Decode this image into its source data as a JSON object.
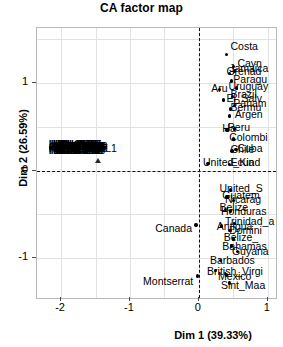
{
  "chart_data": {
    "type": "scatter",
    "title": "CA factor map",
    "xlabel": "Dim 1 (39.33%)",
    "ylabel": "Dim 2 (26.59%)",
    "xlim": [
      -2.35,
      1.12
    ],
    "ylim": [
      -1.45,
      1.62
    ],
    "xticks": [
      -2,
      -1,
      0,
      1
    ],
    "xticklabels": [
      "-2",
      "-1",
      "0",
      "1"
    ],
    "yticks": [
      1,
      0,
      -1
    ],
    "yticklabels": [
      "1",
      "0",
      "-1"
    ],
    "grid": true,
    "legend": "none",
    "reference_lines": {
      "x": 0,
      "y": 0,
      "style": "dashed"
    },
    "series": [
      {
        "name": "rows",
        "marker": "filled-circle",
        "points": [
          {
            "label": "Costa_Rica",
            "x": 0.4,
            "y": 1.32
          },
          {
            "label": "Cayman_Islands",
            "x": 0.5,
            "y": 1.18
          },
          {
            "label": "Grenada",
            "x": 0.44,
            "y": 1.1
          },
          {
            "label": "Jamaica",
            "x": 0.52,
            "y": 1.13
          },
          {
            "label": "Paraguay",
            "x": 0.47,
            "y": 1.02
          },
          {
            "label": "Aruba",
            "x": 0.3,
            "y": 0.92
          },
          {
            "label": "Uruguay",
            "x": 0.55,
            "y": 0.94
          },
          {
            "label": "Brazil",
            "x": 0.49,
            "y": 0.84
          },
          {
            "label": "El_Salvador",
            "x": 0.36,
            "y": 0.8
          },
          {
            "label": "Panama",
            "x": 0.52,
            "y": 0.74
          },
          {
            "label": "Bermuda",
            "x": 0.46,
            "y": 0.7
          },
          {
            "label": "Argentina",
            "x": 0.44,
            "y": 0.62
          },
          {
            "label": "Haiti",
            "x": 0.41,
            "y": 0.46
          },
          {
            "label": "Peru",
            "x": 0.52,
            "y": 0.47
          },
          {
            "label": "Colombia",
            "x": 0.5,
            "y": 0.36
          },
          {
            "label": "Cuba",
            "x": 0.54,
            "y": 0.24
          },
          {
            "label": "Chile",
            "x": 0.48,
            "y": 0.22
          },
          {
            "label": "United_Kingdom",
            "x": 0.13,
            "y": 0.08
          },
          {
            "label": "Ecuador",
            "x": 0.44,
            "y": 0.07
          },
          {
            "label": "United_States",
            "x": 0.46,
            "y": -0.22
          },
          {
            "label": "Guatemala",
            "x": 0.41,
            "y": -0.3
          },
          {
            "label": "Nicaragua",
            "x": 0.5,
            "y": -0.34
          },
          {
            "label": "Belize",
            "x": 0.39,
            "y": -0.44
          },
          {
            "label": "Honduras",
            "x": 0.46,
            "y": -0.46
          },
          {
            "label": "Trinidad_and_Tobago",
            "x": 0.52,
            "y": -0.6
          },
          {
            "label": "Antigua_and_Barbuda",
            "x": 0.33,
            "y": -0.63
          },
          {
            "label": "Dominica",
            "x": 0.45,
            "y": -0.68
          },
          {
            "label": "Belize_2",
            "x": 0.5,
            "y": -0.78
          },
          {
            "label": "Bahamas",
            "x": 0.47,
            "y": -0.86
          },
          {
            "label": "Guyana",
            "x": 0.56,
            "y": -0.92
          },
          {
            "label": "Barbados",
            "x": 0.31,
            "y": -1.02
          },
          {
            "label": "British_Virgin_Islands",
            "x": 0.24,
            "y": -1.14
          },
          {
            "label": "Mexico",
            "x": 0.4,
            "y": -1.19
          },
          {
            "label": "Sint_Maarten",
            "x": 0.44,
            "y": -1.28
          },
          {
            "label": "Canada",
            "x": -0.04,
            "y": -0.62
          },
          {
            "label": "Montserrat",
            "x": -0.02,
            "y": -1.2
          },
          {
            "label": "L1_point",
            "x": -1.74,
            "y": 0.22
          }
        ]
      },
      {
        "name": "supplementary",
        "marker": "filled-triangle",
        "points": [
          {
            "label": "L1",
            "x": -1.46,
            "y": 0.12
          }
        ]
      }
    ],
    "dense_cluster": {
      "note": "unreadable overlapping row labels",
      "x_range": [
        -2.15,
        -1.88
      ],
      "y": 0.27
    },
    "visible_labels": [
      {
        "text": "Costa",
        "x": 0.46,
        "y": 1.4,
        "anchor": "start"
      },
      {
        "text": "Cayn",
        "x": 0.56,
        "y": 1.21,
        "anchor": "start"
      },
      {
        "text": "Grenad",
        "x": 0.4,
        "y": 1.12,
        "anchor": "start"
      },
      {
        "text": "Jamaica",
        "x": 0.44,
        "y": 1.15,
        "anchor": "start"
      },
      {
        "text": "Paragu",
        "x": 0.5,
        "y": 1.03,
        "anchor": "start"
      },
      {
        "text": "Aru",
        "x": 0.18,
        "y": 0.93,
        "anchor": "start"
      },
      {
        "text": "Uruguay",
        "x": 0.43,
        "y": 0.95,
        "anchor": "start"
      },
      {
        "text": "Brazil",
        "x": 0.46,
        "y": 0.86,
        "anchor": "start"
      },
      {
        "text": "El_Salv",
        "x": 0.4,
        "y": 0.81,
        "anchor": "start"
      },
      {
        "text": "Panam",
        "x": 0.5,
        "y": 0.76,
        "anchor": "start"
      },
      {
        "text": "Bermu",
        "x": 0.46,
        "y": 0.71,
        "anchor": "start"
      },
      {
        "text": "Argen",
        "x": 0.52,
        "y": 0.63,
        "anchor": "start"
      },
      {
        "text": "Ha",
        "x": 0.34,
        "y": 0.47,
        "anchor": "start"
      },
      {
        "text": "Peru",
        "x": 0.42,
        "y": 0.48,
        "anchor": "start"
      },
      {
        "text": "Colombi",
        "x": 0.44,
        "y": 0.37,
        "anchor": "start"
      },
      {
        "text": "Cuba",
        "x": 0.56,
        "y": 0.25,
        "anchor": "start"
      },
      {
        "text": "Chile",
        "x": 0.46,
        "y": 0.23,
        "anchor": "start"
      },
      {
        "text": "United_Kin",
        "x": 0.06,
        "y": 0.09,
        "anchor": "start"
      },
      {
        "text": "Ecuad",
        "x": 0.46,
        "y": 0.08,
        "anchor": "start"
      },
      {
        "text": "United_S",
        "x": 0.3,
        "y": -0.21,
        "anchor": "start"
      },
      {
        "text": "Guatem",
        "x": 0.34,
        "y": -0.29,
        "anchor": "start"
      },
      {
        "text": "Nicarag",
        "x": 0.38,
        "y": -0.33,
        "anchor": "start"
      },
      {
        "text": "Belize",
        "x": 0.3,
        "y": -0.43,
        "anchor": "start"
      },
      {
        "text": "Honduras",
        "x": 0.32,
        "y": -0.47,
        "anchor": "start"
      },
      {
        "text": "Trinidad_a",
        "x": 0.38,
        "y": -0.59,
        "anchor": "start"
      },
      {
        "text": "Antigua",
        "x": 0.26,
        "y": -0.64,
        "anchor": "start"
      },
      {
        "text": "Domini",
        "x": 0.44,
        "y": -0.69,
        "anchor": "start"
      },
      {
        "text": "Belize_",
        "x": 0.36,
        "y": -0.77,
        "anchor": "start"
      },
      {
        "text": "Bahamas",
        "x": 0.34,
        "y": -0.87,
        "anchor": "start"
      },
      {
        "text": "Guyana",
        "x": 0.48,
        "y": -0.93,
        "anchor": "start"
      },
      {
        "text": "Barbados",
        "x": 0.16,
        "y": -1.03,
        "anchor": "start"
      },
      {
        "text": "British_Virgi",
        "x": 0.12,
        "y": -1.15,
        "anchor": "start"
      },
      {
        "text": "Mexico",
        "x": 0.28,
        "y": -1.21,
        "anchor": "start"
      },
      {
        "text": "Sint_Maa",
        "x": 0.32,
        "y": -1.31,
        "anchor": "start"
      },
      {
        "text": "Canada",
        "x": -0.1,
        "y": -0.66,
        "anchor": "end"
      },
      {
        "text": "Montserrat",
        "x": -0.08,
        "y": -1.27,
        "anchor": "end"
      },
      {
        "text": "L1",
        "x": -1.36,
        "y": 0.24,
        "anchor": "start"
      }
    ]
  }
}
